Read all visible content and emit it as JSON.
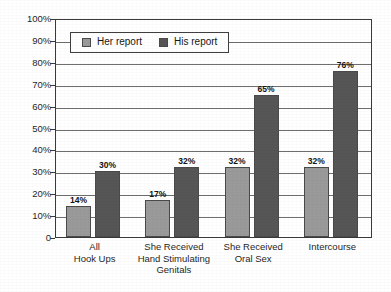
{
  "chart_data": {
    "type": "bar",
    "title": "",
    "subtitle": "",
    "xlabel": "",
    "ylabel": "",
    "categories": [
      "All\nHook Ups",
      "She Received\nHand Stimulating\nGenitals",
      "She Received\nOral Sex",
      "Intercourse"
    ],
    "series": [
      {
        "name": "Her report",
        "values": [
          14,
          17,
          32,
          32
        ],
        "color": "#9a9a9a"
      },
      {
        "name": "His report",
        "values": [
          30,
          32,
          65,
          76
        ],
        "color": "#565656"
      }
    ],
    "value_labels": [
      [
        "14%",
        "17%",
        "32%",
        "32%"
      ],
      [
        "30%",
        "32%",
        "65%",
        "76%"
      ]
    ],
    "ylim": [
      0,
      100
    ],
    "ytick_values": [
      0,
      10,
      20,
      30,
      40,
      50,
      60,
      70,
      80,
      90,
      100
    ],
    "ytick_labels": [
      "0",
      "10%",
      "20%",
      "30%",
      "40%",
      "50%",
      "60%",
      "70%",
      "80%",
      "90%",
      "100%"
    ],
    "grid": true,
    "legend_position": "inside-top-left",
    "legend_entries": [
      "Her report",
      "His report"
    ]
  },
  "legend": {
    "entries": [
      {
        "label": "Her report"
      },
      {
        "label": "His report"
      }
    ]
  },
  "axis": {
    "categories": [
      {
        "lines": [
          "All",
          "Hook Ups"
        ]
      },
      {
        "lines": [
          "She Received",
          "Hand Stimulating",
          "Genitals"
        ]
      },
      {
        "lines": [
          "She Received",
          "Oral Sex"
        ]
      },
      {
        "lines": [
          "Intercourse"
        ]
      }
    ]
  },
  "colors": {
    "her_report": "#9a9a9a",
    "his_report": "#565656",
    "axis": "#3a3a3a",
    "gridline": "#6e6e6e",
    "background": "#ffffff"
  }
}
